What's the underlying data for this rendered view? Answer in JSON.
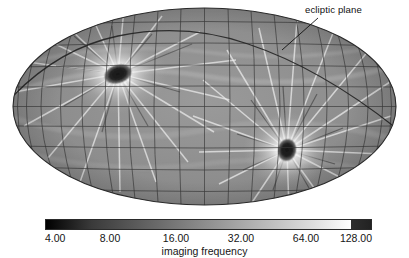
{
  "figure": {
    "kind": "all-sky-exposure-map",
    "projection": "mollweide-ellipse",
    "background_color": "#ffffff"
  },
  "annotations": [
    {
      "id": "ecliptic-plane",
      "label": "ecliptic plane",
      "text_x": 305,
      "text_y": 4,
      "leader_from": [
        318,
        18
      ],
      "leader_to": [
        282,
        50
      ]
    }
  ],
  "colorbar": {
    "title": "imaging frequency",
    "x": 45,
    "y": 219,
    "width": 327,
    "height": 11,
    "scale": "log2",
    "vmin": 4.0,
    "vmax": 128.0,
    "low_color": "#000000",
    "high_color": "#ffffff",
    "overflow_color": "#2e2e2e",
    "overflow_start_fraction": 0.935,
    "ticks": [
      {
        "label": "4.00",
        "value": 4.0,
        "x": 45,
        "align": "left"
      },
      {
        "label": "8.00",
        "value": 8.0,
        "x": 110,
        "align": "center"
      },
      {
        "label": "16.00",
        "value": 16.0,
        "x": 176,
        "align": "center"
      },
      {
        "label": "32.00",
        "value": 32.0,
        "x": 241,
        "align": "center"
      },
      {
        "label": "64.00",
        "value": 64.0,
        "x": 306,
        "align": "center"
      },
      {
        "label": "128.00",
        "value": 128.0,
        "x": 372,
        "align": "right"
      }
    ]
  },
  "chart_data": {
    "type": "heatmap",
    "title": "",
    "xlabel": "",
    "ylabel": "",
    "colorbar_label": "imaging frequency",
    "projection": "Mollweide all-sky (elliptical)",
    "color_scale": "logarithmic (powers of two)",
    "value_range": [
      4.0,
      128.0
    ],
    "tick_values": [
      4.0,
      8.0,
      16.0,
      32.0,
      64.0,
      128.0
    ],
    "grid": true,
    "graticule": {
      "meridian_spacing_deg": 15,
      "parallel_spacing_deg": 15,
      "line_color": "#3a3a3a"
    },
    "legend_position": "bottom",
    "ellipse": {
      "cx": 204.5,
      "cy": 106.5,
      "rx": 191.5,
      "ry": 98.5
    },
    "background_level": 14,
    "features": [
      {
        "name": "deep-field-hotspot-north",
        "description": "dark saturated core with radiating streaks and bright halo",
        "center": [
          118,
          74
        ],
        "core_radius": 13,
        "halo_radius": 46,
        "peak_value": 128.0,
        "core_color": "#1c1c1c",
        "halo_color": "#f2f2f2",
        "ray_count": 26
      },
      {
        "name": "deep-field-hotspot-south",
        "description": "dark saturated core with radiating streaks and bright halo",
        "center": [
          287,
          150
        ],
        "core_radius": 11,
        "halo_radius": 40,
        "peak_value": 128.0,
        "core_color": "#1c1c1c",
        "halo_color": "#f2f2f2",
        "ray_count": 26
      }
    ],
    "ecliptic_curve": {
      "label": "ecliptic plane",
      "color": "#2b2b2b",
      "inclination_deg": 60
    }
  }
}
